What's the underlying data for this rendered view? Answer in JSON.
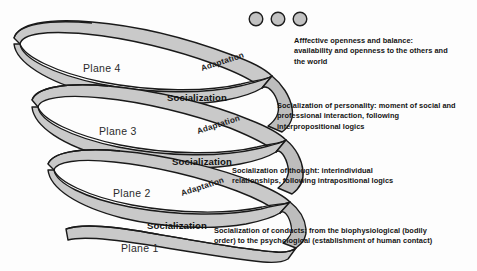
{
  "figure": {
    "type": "spiral-diagram",
    "background_color": "#fdfdfd",
    "ribbon_fill": "#c9c9c9",
    "ribbon_stroke": "#1a1a1a",
    "node_fill": "#c2c2c2"
  },
  "nodes": {
    "count": 3,
    "label": "three-dots"
  },
  "planes": [
    {
      "id": "plane-4",
      "label": "Plane 4"
    },
    {
      "id": "plane-3",
      "label": "Plane 3"
    },
    {
      "id": "plane-2",
      "label": "Plane 2"
    },
    {
      "id": "plane-1",
      "label": "Plane  1"
    }
  ],
  "adaptation_labels": [
    {
      "id": "adaptation-4",
      "label": "Adaptation"
    },
    {
      "id": "adaptation-3",
      "label": "Adaptation"
    },
    {
      "id": "adaptation-2",
      "label": "Adaptation"
    }
  ],
  "socialization_labels": [
    {
      "id": "socialization-3",
      "label": "Socialization"
    },
    {
      "id": "socialization-2",
      "label": "Socialization"
    },
    {
      "id": "socialization-1",
      "label": "Socialization"
    }
  ],
  "descriptions": [
    {
      "id": "description-plane-4",
      "text": "Afffective openness and balance:\navailability and openness to the others and\nthe world"
    },
    {
      "id": "description-plane-3",
      "text": "Socialization of personality: moment of social and\nprofessional interaction, following\ninterpropositional logics"
    },
    {
      "id": "description-plane-2",
      "text": "Socialization of thought: interindividual\nrelationships, following intrapositional logics"
    },
    {
      "id": "description-plane-1",
      "text": "Socialization of conducts: from the biophysiological (bodily\norder) to the psychological (establishment of human contact)"
    }
  ]
}
